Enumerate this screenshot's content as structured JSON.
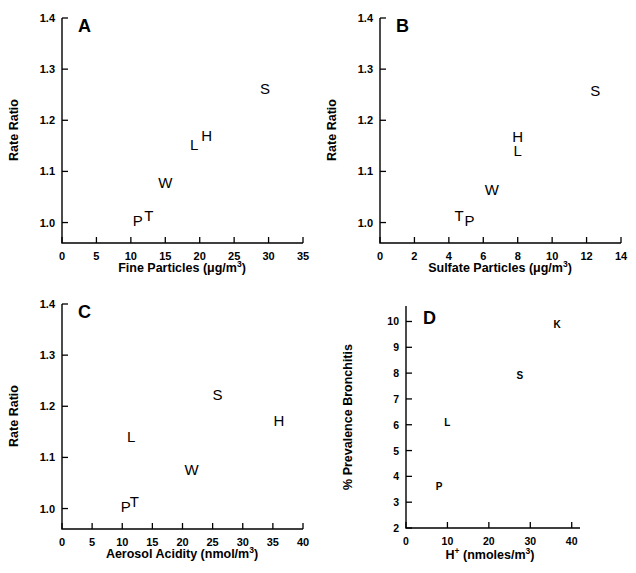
{
  "figure": {
    "background": "#ffffff",
    "ink": "#000000",
    "panel_count": 4
  },
  "chart_data": [
    {
      "type": "scatter",
      "panel": "A",
      "title": "",
      "xlabel": "Fine Particles (μg/m³)",
      "xlabel_base": "Fine Particles (μg/m",
      "xlabel_sup": "3",
      "xlabel_tail": ")",
      "ylabel": "Rate Ratio",
      "xlim": [
        0,
        35
      ],
      "ylim": [
        0.96,
        1.4
      ],
      "xticks": [
        0,
        5,
        10,
        15,
        20,
        25,
        30,
        35
      ],
      "yticks": [
        1.0,
        1.1,
        1.2,
        1.3,
        1.4
      ],
      "xticklabels": [
        "0",
        "5",
        "10",
        "15",
        "20",
        "25",
        "30",
        "35"
      ],
      "yticklabels": [
        "1.0",
        "1.1",
        "1.2",
        "1.3",
        "1.4"
      ],
      "grid": false,
      "legend": "none",
      "point_labels": [
        "P",
        "T",
        "W",
        "L",
        "H",
        "S"
      ],
      "points": [
        {
          "label": "P",
          "x": 11.0,
          "y": 1.003
        },
        {
          "label": "T",
          "x": 12.6,
          "y": 1.012
        },
        {
          "label": "W",
          "x": 15.0,
          "y": 1.077
        },
        {
          "label": "L",
          "x": 19.2,
          "y": 1.152
        },
        {
          "label": "H",
          "x": 21.0,
          "y": 1.17
        },
        {
          "label": "S",
          "x": 29.5,
          "y": 1.262
        }
      ]
    },
    {
      "type": "scatter",
      "panel": "B",
      "title": "",
      "xlabel": "Sulfate Particles (μg/m³)",
      "xlabel_base": "Sulfate Particles (μg/m",
      "xlabel_sup": "3",
      "xlabel_tail": ")",
      "ylabel": "Rate Ratio",
      "xlim": [
        0,
        14
      ],
      "ylim": [
        0.96,
        1.4
      ],
      "xticks": [
        0,
        2,
        4,
        6,
        8,
        10,
        12,
        14
      ],
      "yticks": [
        1.0,
        1.1,
        1.2,
        1.3,
        1.4
      ],
      "xticklabels": [
        "0",
        "2",
        "4",
        "6",
        "8",
        "10",
        "12",
        "14"
      ],
      "yticklabels": [
        "1.0",
        "1.1",
        "1.2",
        "1.3",
        "1.4"
      ],
      "grid": false,
      "legend": "none",
      "point_labels": [
        "T",
        "P",
        "W",
        "L",
        "H",
        "S"
      ],
      "points": [
        {
          "label": "T",
          "x": 4.6,
          "y": 1.012
        },
        {
          "label": "P",
          "x": 5.2,
          "y": 1.003
        },
        {
          "label": "W",
          "x": 6.5,
          "y": 1.063
        },
        {
          "label": "L",
          "x": 8.0,
          "y": 1.14
        },
        {
          "label": "H",
          "x": 8.0,
          "y": 1.168
        },
        {
          "label": "S",
          "x": 12.5,
          "y": 1.258
        }
      ]
    },
    {
      "type": "scatter",
      "panel": "C",
      "title": "",
      "xlabel": "Aerosol Acidity (nmol/m³)",
      "xlabel_base": "Aerosol Acidity (nmol/m",
      "xlabel_sup": "3",
      "xlabel_tail": ")",
      "ylabel": "Rate Ratio",
      "xlim": [
        0,
        40
      ],
      "ylim": [
        0.96,
        1.4
      ],
      "xticks": [
        0,
        5,
        10,
        15,
        20,
        25,
        30,
        35,
        40
      ],
      "yticks": [
        1.0,
        1.1,
        1.2,
        1.3,
        1.4
      ],
      "xticklabels": [
        "0",
        "5",
        "10",
        "15",
        "20",
        "25",
        "30",
        "35",
        "40"
      ],
      "yticklabels": [
        "1.0",
        "1.1",
        "1.2",
        "1.3",
        "1.4"
      ],
      "grid": false,
      "legend": "none",
      "point_labels": [
        "P",
        "T",
        "W",
        "L",
        "S",
        "H"
      ],
      "points": [
        {
          "label": "P",
          "x": 10.6,
          "y": 1.003
        },
        {
          "label": "T",
          "x": 12.0,
          "y": 1.012
        },
        {
          "label": "W",
          "x": 21.5,
          "y": 1.075
        },
        {
          "label": "L",
          "x": 11.5,
          "y": 1.14
        },
        {
          "label": "S",
          "x": 25.8,
          "y": 1.222
        },
        {
          "label": "H",
          "x": 36.0,
          "y": 1.172
        }
      ]
    },
    {
      "type": "scatter",
      "panel": "D",
      "title": "",
      "xlabel": "H⁺ (nmoles/m³)",
      "xlabel_base": "H",
      "xlabel_sup_plus": "+",
      "xlabel_mid": " (nmoles/m",
      "xlabel_sup": "3",
      "xlabel_tail": ")",
      "ylabel": "% Prevalence Bronchitis",
      "xlim": [
        0,
        42
      ],
      "ylim": [
        2,
        10.6
      ],
      "xticks": [
        0,
        10,
        20,
        30,
        40
      ],
      "yticks": [
        2,
        3,
        4,
        5,
        6,
        7,
        8,
        9,
        10
      ],
      "xticklabels": [
        "0",
        "10",
        "20",
        "30",
        "40"
      ],
      "yticklabels": [
        "2",
        "3",
        "4",
        "5",
        "6",
        "7",
        "8",
        "9",
        "10"
      ],
      "grid": false,
      "legend": "none",
      "point_labels": [
        "P",
        "L",
        "S",
        "K"
      ],
      "points": [
        {
          "label": "P",
          "x": 8.0,
          "y": 3.65
        },
        {
          "label": "L",
          "x": 10.0,
          "y": 6.15
        },
        {
          "label": "S",
          "x": 27.5,
          "y": 7.95
        },
        {
          "label": "K",
          "x": 36.5,
          "y": 9.95
        }
      ]
    }
  ],
  "panels": {
    "a": {
      "letter": "A"
    },
    "b": {
      "letter": "B"
    },
    "c": {
      "letter": "C"
    },
    "d": {
      "letter": "D"
    }
  }
}
